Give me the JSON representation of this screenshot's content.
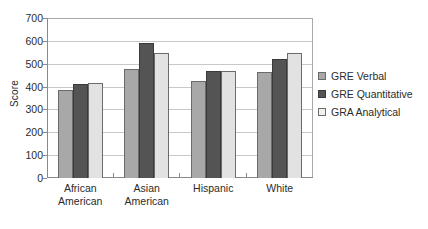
{
  "chart_data": {
    "type": "bar",
    "title": "",
    "subtitle": "",
    "xlabel": "",
    "ylabel": "Score",
    "ylim": [
      0,
      700
    ],
    "ytick_step": 100,
    "yticks": [
      "700",
      "600",
      "500",
      "400",
      "300",
      "200",
      "100",
      "0"
    ],
    "grid": true,
    "legend_position": "right",
    "categories": [
      {
        "line1": "African",
        "line2": "American"
      },
      {
        "line1": "Asian",
        "line2": "American"
      },
      {
        "line1": "Hispanic",
        "line2": ""
      },
      {
        "line1": "White",
        "line2": ""
      }
    ],
    "category_labels": [
      "African American",
      "Asian American",
      "Hispanic",
      "White"
    ],
    "series": [
      {
        "name": "GRE Verbal",
        "color": "#a8a8a8",
        "values": [
          385,
          478,
          423,
          465
        ]
      },
      {
        "name": "GRE Quantitative",
        "color": "#545454",
        "values": [
          412,
          592,
          468,
          522
        ]
      },
      {
        "name": "GRA Analytical",
        "color": "#f0f0f0",
        "values": [
          415,
          547,
          470,
          547
        ]
      }
    ]
  },
  "colors": {
    "axis": "#8a8a8a",
    "grid": "#c8c8c8",
    "text": "#2b2b2b",
    "background": "#ffffff"
  }
}
